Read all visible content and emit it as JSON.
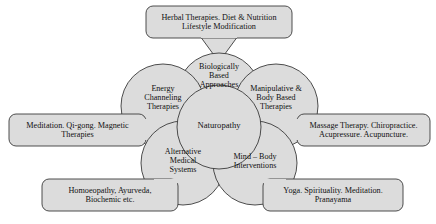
{
  "diagram": {
    "center": {
      "id": "naturopathy",
      "label": "Naturopathy"
    },
    "colors": {
      "node_fill": "#dcdcdc",
      "node_stroke": "#3a3a3a",
      "text": "#111111",
      "background": "#ffffff"
    },
    "petals": [
      {
        "id": "biologically-based-approaches",
        "position": "top",
        "label_lines": [
          "Biologically",
          "Based",
          "Approaches"
        ]
      },
      {
        "id": "energy-channeling-therapies",
        "position": "upper-left",
        "label_lines": [
          "Energy",
          "Channeling",
          "Therapies"
        ]
      },
      {
        "id": "manipulative-body-based-therapies",
        "position": "upper-right",
        "label_lines": [
          "Manipulative &",
          "Body Based",
          "Therapies"
        ]
      },
      {
        "id": "alternative-medical-systems",
        "position": "lower-left",
        "label_lines": [
          "Alternative",
          "Medical",
          "Systems"
        ]
      },
      {
        "id": "mind-body-interventions",
        "position": "lower-right",
        "label_lines": [
          "Mind – Body",
          "Interventions"
        ]
      }
    ],
    "callouts": [
      {
        "id": "callout-biologically-based",
        "for": "biologically-based-approaches",
        "position": "top",
        "label_lines": [
          "Herbal Therapies. Diet & Nutrition",
          "Lifestyle Modification"
        ]
      },
      {
        "id": "callout-energy-channeling",
        "for": "energy-channeling-therapies",
        "position": "left",
        "label_lines": [
          "Meditation. Qi-gong. Magnetic",
          "Therapies"
        ]
      },
      {
        "id": "callout-manipulative",
        "for": "manipulative-body-based-therapies",
        "position": "right",
        "label_lines": [
          "Massage Therapy. Chiropractice.",
          "Acupressure. Acupuncture."
        ]
      },
      {
        "id": "callout-alternative-medical",
        "for": "alternative-medical-systems",
        "position": "bottom-left",
        "label_lines": [
          "Homoeopathy, Ayurveda,",
          "Biochemic etc."
        ]
      },
      {
        "id": "callout-mind-body",
        "for": "mind-body-interventions",
        "position": "bottom-right",
        "label_lines": [
          "Yoga. Spirituality. Meditation.",
          "Pranayama"
        ]
      }
    ]
  }
}
